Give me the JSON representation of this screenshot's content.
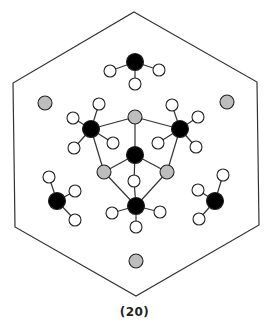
{
  "figure": {
    "caption": "(20)",
    "colors": {
      "outline": "#333333",
      "carbon": "#000000",
      "gray_atom": "#bdbdbd",
      "hydrogen": "#ffffff",
      "bond": "#333333"
    },
    "hexagon": [
      [
        134,
        12
      ],
      [
        257,
        82
      ],
      [
        259,
        225
      ],
      [
        136,
        296
      ],
      [
        15,
        227
      ],
      [
        13,
        83
      ]
    ],
    "atoms": [
      {
        "id": "c_top",
        "type": "carbon",
        "x": 135,
        "y": 62
      },
      {
        "id": "h_top1",
        "type": "hydrogen",
        "x": 110,
        "y": 71
      },
      {
        "id": "h_top2",
        "type": "hydrogen",
        "x": 159,
        "y": 70
      },
      {
        "id": "h_top3",
        "type": "hydrogen",
        "x": 135,
        "y": 84
      },
      {
        "id": "g_left",
        "type": "gray",
        "x": 45,
        "y": 103
      },
      {
        "id": "g_right",
        "type": "gray",
        "x": 227,
        "y": 102
      },
      {
        "id": "g_center_top",
        "type": "gray",
        "x": 135,
        "y": 117
      },
      {
        "id": "c_left",
        "type": "carbon",
        "x": 91,
        "y": 129
      },
      {
        "id": "h_l1",
        "type": "hydrogen",
        "x": 99,
        "y": 104
      },
      {
        "id": "h_l2",
        "type": "hydrogen",
        "x": 73,
        "y": 118
      },
      {
        "id": "h_l3",
        "type": "hydrogen",
        "x": 74,
        "y": 148
      },
      {
        "id": "h_l4",
        "type": "hydrogen",
        "x": 113,
        "y": 143
      },
      {
        "id": "c_right",
        "type": "carbon",
        "x": 180,
        "y": 129
      },
      {
        "id": "h_r1",
        "type": "hydrogen",
        "x": 172,
        "y": 105
      },
      {
        "id": "h_r2",
        "type": "hydrogen",
        "x": 198,
        "y": 117
      },
      {
        "id": "h_r3",
        "type": "hydrogen",
        "x": 196,
        "y": 147
      },
      {
        "id": "h_r4",
        "type": "hydrogen",
        "x": 158,
        "y": 143
      },
      {
        "id": "c_center",
        "type": "carbon",
        "x": 135,
        "y": 155
      },
      {
        "id": "g_lower_left",
        "type": "gray",
        "x": 104,
        "y": 172
      },
      {
        "id": "g_lower_right",
        "type": "gray",
        "x": 167,
        "y": 172
      },
      {
        "id": "h_mid",
        "type": "hydrogen",
        "x": 134,
        "y": 181
      },
      {
        "id": "c_bottom",
        "type": "carbon",
        "x": 136,
        "y": 206
      },
      {
        "id": "h_b1",
        "type": "hydrogen",
        "x": 112,
        "y": 213
      },
      {
        "id": "h_b2",
        "type": "hydrogen",
        "x": 160,
        "y": 212
      },
      {
        "id": "h_b3",
        "type": "hydrogen",
        "x": 136,
        "y": 227
      },
      {
        "id": "c_lm",
        "type": "carbon",
        "x": 57,
        "y": 201
      },
      {
        "id": "h_lm1",
        "type": "hydrogen",
        "x": 49,
        "y": 177
      },
      {
        "id": "h_lm2",
        "type": "hydrogen",
        "x": 75,
        "y": 191
      },
      {
        "id": "h_lm3",
        "type": "hydrogen",
        "x": 75,
        "y": 220
      },
      {
        "id": "c_rm",
        "type": "carbon",
        "x": 215,
        "y": 201
      },
      {
        "id": "h_rm1",
        "type": "hydrogen",
        "x": 223,
        "y": 175
      },
      {
        "id": "h_rm2",
        "type": "hydrogen",
        "x": 198,
        "y": 190
      },
      {
        "id": "h_rm3",
        "type": "hydrogen",
        "x": 199,
        "y": 219
      },
      {
        "id": "g_bottom",
        "type": "gray",
        "x": 136,
        "y": 261
      }
    ],
    "bonds": [
      [
        "c_top",
        "h_top1"
      ],
      [
        "c_top",
        "h_top2"
      ],
      [
        "c_top",
        "h_top3"
      ],
      [
        "c_left",
        "h_l1"
      ],
      [
        "c_left",
        "h_l2"
      ],
      [
        "c_left",
        "h_l3"
      ],
      [
        "c_left",
        "h_l4"
      ],
      [
        "c_right",
        "h_r1"
      ],
      [
        "c_right",
        "h_r2"
      ],
      [
        "c_right",
        "h_r3"
      ],
      [
        "c_right",
        "h_r4"
      ],
      [
        "c_left",
        "g_center_top"
      ],
      [
        "g_center_top",
        "c_right"
      ],
      [
        "g_center_top",
        "c_center"
      ],
      [
        "c_left",
        "g_lower_left"
      ],
      [
        "c_right",
        "g_lower_right"
      ],
      [
        "c_center",
        "g_lower_left"
      ],
      [
        "c_center",
        "g_lower_right"
      ],
      [
        "c_center",
        "h_mid"
      ],
      [
        "g_lower_left",
        "c_bottom"
      ],
      [
        "g_lower_right",
        "c_bottom"
      ],
      [
        "h_mid",
        "c_bottom"
      ],
      [
        "c_bottom",
        "h_b1"
      ],
      [
        "c_bottom",
        "h_b2"
      ],
      [
        "c_bottom",
        "h_b3"
      ],
      [
        "c_lm",
        "h_lm1"
      ],
      [
        "c_lm",
        "h_lm2"
      ],
      [
        "c_lm",
        "h_lm3"
      ],
      [
        "c_rm",
        "h_rm1"
      ],
      [
        "c_rm",
        "h_rm2"
      ],
      [
        "c_rm",
        "h_rm3"
      ]
    ]
  }
}
